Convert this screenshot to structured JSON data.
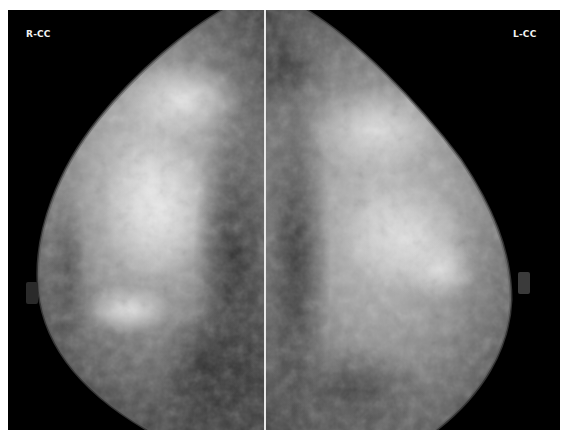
{
  "image": {
    "description": "Bilateral craniocaudal mammogram views shown side by side",
    "views": [
      {
        "id": "right",
        "label": "R-CC"
      },
      {
        "id": "left",
        "label": "L-CC"
      }
    ]
  },
  "colors": {
    "background": "#000000",
    "divider": "#e8e8e8",
    "label_text": "#f2f2f2"
  }
}
